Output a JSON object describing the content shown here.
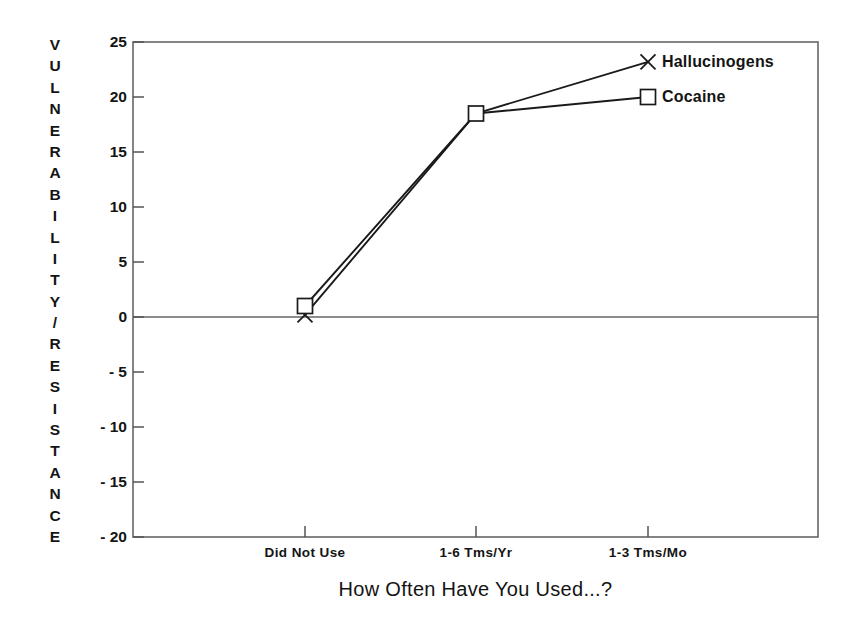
{
  "chart_data": {
    "type": "line",
    "title": "",
    "xlabel": "How Often Have You Used...?",
    "ylabel": "VULNERABILITY/RESISTANCE",
    "categories": [
      "Did Not Use",
      "1-6 Tms/Yr",
      "1-3 Tms/Mo"
    ],
    "ylim": [
      -20,
      25
    ],
    "yticks": [
      25,
      20,
      15,
      10,
      5,
      0,
      -5,
      -10,
      -15,
      -20
    ],
    "ytick_labels": [
      "25",
      "20",
      "15",
      "10",
      "5",
      "0",
      "- 5",
      "- 10",
      "- 15",
      "- 20"
    ],
    "grid": false,
    "legend": "inline-right",
    "zero_line": true,
    "series": [
      {
        "name": "Hallucinogens",
        "marker": "x",
        "values": [
          0.2,
          18.5,
          23.2
        ]
      },
      {
        "name": "Cocaine",
        "marker": "square",
        "values": [
          1.0,
          18.5,
          20.0
        ]
      }
    ],
    "colors": {
      "line": "#1a1a1a",
      "axis": "#555555",
      "text": "#141414",
      "background": "#ffffff"
    }
  },
  "axis": {
    "y_title_chars": [
      "V",
      "U",
      "L",
      "N",
      "E",
      "R",
      "A",
      "B",
      "I",
      "L",
      "I",
      "T",
      "Y",
      "/",
      "R",
      "E",
      "S",
      "I",
      "S",
      "T",
      "A",
      "N",
      "C",
      "E"
    ],
    "x_title": "How Often Have You Used...?",
    "x_tick_labels": [
      "Did Not Use",
      "1-6 Tms/Yr",
      "1-3 Tms/Mo"
    ],
    "y_tick_labels": [
      "25",
      "20",
      "15",
      "10",
      "5",
      "0",
      "- 5",
      "- 10",
      "- 15",
      "- 20"
    ]
  },
  "series_labels": {
    "hallucinogens": "Hallucinogens",
    "cocaine": "Cocaine"
  }
}
